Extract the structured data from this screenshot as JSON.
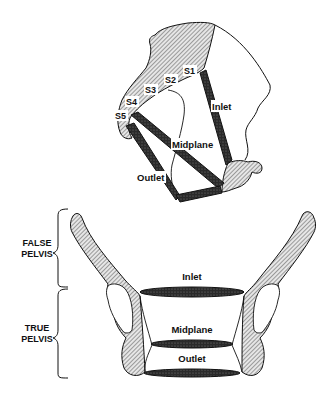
{
  "diagram": {
    "sagittal_view": {
      "sacral_labels": [
        "S1",
        "S2",
        "S3",
        "S4",
        "S5"
      ],
      "planes": {
        "inlet": "Inlet",
        "midplane": "Midplane",
        "outlet": "Outlet"
      }
    },
    "frontal_view": {
      "regions": {
        "false_pelvis_line1": "FALSE",
        "false_pelvis_line2": "PELVIS",
        "true_pelvis_line1": "TRUE",
        "true_pelvis_line2": "PELVIS"
      },
      "planes": {
        "inlet": "Inlet",
        "midplane": "Midplane",
        "outlet": "Outlet"
      }
    },
    "colors": {
      "ink": "#111111",
      "bone_hatch": "#888888",
      "plane_fill": "#2a2a2a",
      "background": "#ffffff"
    }
  }
}
